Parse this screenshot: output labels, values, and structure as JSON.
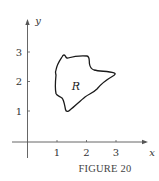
{
  "figure": {
    "caption": "FIGURE 20",
    "axes": {
      "x_label": "x",
      "y_label": "y",
      "x_ticks": [
        "1",
        "2",
        "3"
      ],
      "y_ticks": [
        "1",
        "2",
        "3"
      ]
    },
    "region": {
      "label": "R",
      "description": "Irregular closed region bounded by a curve",
      "approx_vertices": [
        {
          "x": 1.25,
          "y": 2.85
        },
        {
          "x": 1.95,
          "y": 2.85
        },
        {
          "x": 2.1,
          "y": 2.45
        },
        {
          "x": 2.95,
          "y": 2.3
        },
        {
          "x": 2.3,
          "y": 1.5
        },
        {
          "x": 1.35,
          "y": 1.0
        },
        {
          "x": 1.15,
          "y": 1.5
        },
        {
          "x": 0.95,
          "y": 2.3
        }
      ]
    },
    "colors": {
      "axis": "#555555",
      "curve": "#1a1a1a",
      "text": "#333333"
    }
  }
}
